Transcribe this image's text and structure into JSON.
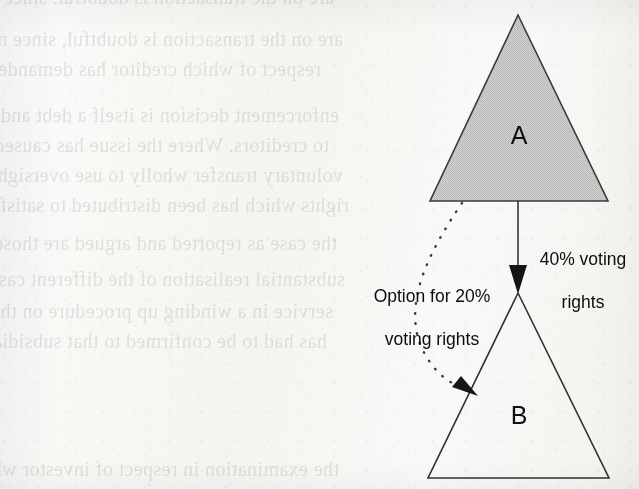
{
  "page": {
    "width": 639,
    "height": 489,
    "background_color": "#f7f7f5",
    "kind": "scanned-book-page-diagram"
  },
  "diagram": {
    "type": "corporate-shareholding-structure",
    "nodes": [
      {
        "id": "A",
        "label": "A",
        "shape": "triangle",
        "fill": "#c9c9c7",
        "stroke": "#3a3a38",
        "apex": [
          518,
          15
        ],
        "base_left": [
          430,
          201
        ],
        "base_right": [
          608,
          201
        ]
      },
      {
        "id": "B",
        "label": "B",
        "shape": "triangle",
        "fill": "#ffffff",
        "stroke": "#303030",
        "apex": [
          518,
          293
        ],
        "base_left": [
          428,
          478
        ],
        "base_right": [
          609,
          478
        ]
      }
    ],
    "edges": [
      {
        "id": "solid-holding",
        "from": "A",
        "to": "B",
        "style": "solid",
        "arrow": "filled-triangle",
        "label": "40% voting\nrights",
        "label_line_1": "40% voting",
        "label_line_2": "rights",
        "color": "#2b2b2b"
      },
      {
        "id": "dotted-option",
        "from": "A",
        "to": "B",
        "style": "dotted",
        "arrow": "filled-triangle",
        "label": "Option for 20%\nvoting rights",
        "label_line_1": "Option for 20%",
        "label_line_2": "voting rights",
        "color": "#2b2b2b"
      }
    ]
  },
  "bleed_through_text": {
    "note": "faint mirrored text showing through from the reverse side of the scanned page",
    "lines": [
      "are on the transaction is doubtful, since most p",
      "respect of which creditor has demanded cont",
      "enforcement decision is itself a debt and is enforcemently",
      "to creditors. Where the issue has caused real literate",
      "voluntary transfer wholly to use oversight in determine",
      "rights which has been distributed to satisfy the principal on",
      "the case as reported and argued are those for which",
      "substantial realisation of the different case reading is large",
      "service in a winding up procedure on the provide utility with",
      "has had to be confirmed to that subsidiary has lower ever",
      "the examination in respect of investor who considers the"
    ]
  }
}
